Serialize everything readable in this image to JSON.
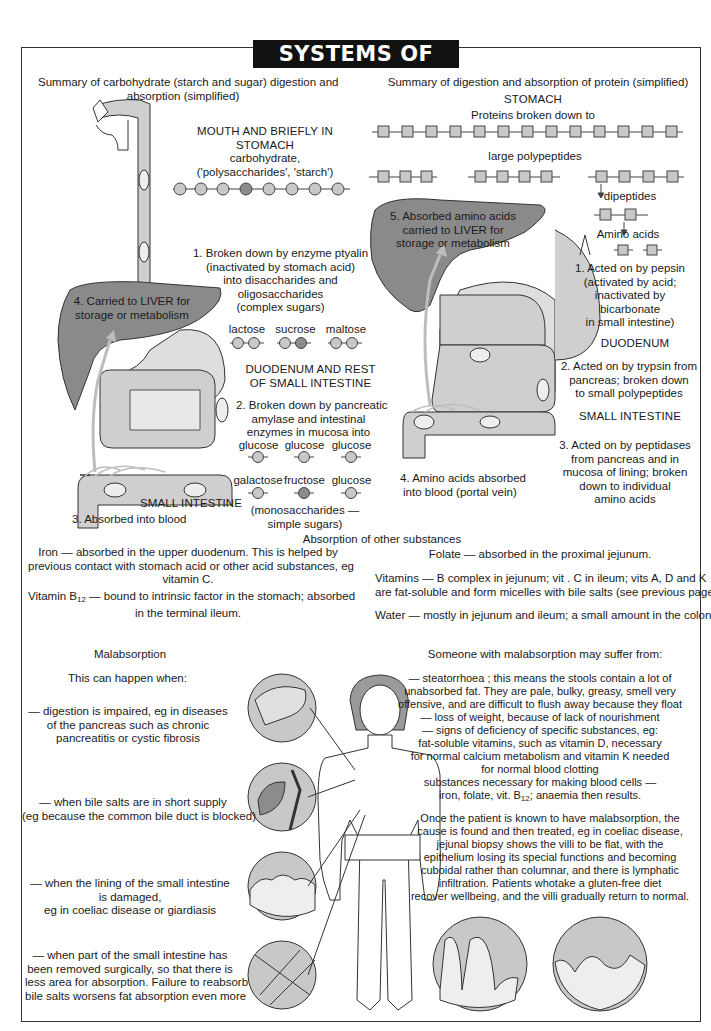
{
  "title": "SYSTEMS OF LIFE",
  "colors": {
    "liver": "#8a8a8a",
    "organ_light": "#cfcfcf",
    "organ_mid": "#b8b8b8",
    "molecule_light": "#c8c8c8",
    "molecule_dark": "#8c8c8c",
    "blood_arrow": "#bdbdbd",
    "text": "#1a1a1a",
    "title_bg": "#111111"
  },
  "carbohydrate": {
    "heading": [
      "Summary of carbohydrate (starch and sugar) digestion and",
      "absorption (simplified)"
    ],
    "mouth_label": [
      "MOUTH AND BRIEFLY IN",
      "STOMACH"
    ],
    "carb_label": [
      "carbohydrate,",
      "('polysaccharides', 'starch')"
    ],
    "polysaccharide_beads": [
      "light",
      "light",
      "light",
      "dark",
      "light",
      "light",
      "light",
      "light"
    ],
    "step1": [
      "1. Broken down by enzyme ptyalin",
      "(inactivated by stomach acid)",
      "into disaccharides and",
      "oligosaccharides",
      "(complex sugars)"
    ],
    "disaccharides": [
      {
        "name": "lactose",
        "beads": [
          "light",
          "light"
        ]
      },
      {
        "name": "sucrose",
        "beads": [
          "light",
          "dark"
        ]
      },
      {
        "name": "maltose",
        "beads": [
          "light",
          "light"
        ]
      }
    ],
    "liver_label": [
      "4. Carried to LIVER for",
      "storage or metabolism"
    ],
    "duodenum_label": [
      "DUODENUM AND REST",
      "OF SMALL INTESTINE"
    ],
    "step2": [
      "2. Broken down by pancreatic",
      "amylase and intestinal",
      "enzymes in mucosa into"
    ],
    "monosaccharides_row1": [
      "glucose",
      "glucose",
      "glucose"
    ],
    "monosaccharides_row2": [
      "galactose",
      "fructose",
      "glucose"
    ],
    "mono_note": [
      "(monosaccharides —",
      "simple sugars)"
    ],
    "small_intestine_label": "SMALL INTESTINE",
    "step3": "3. Absorbed into blood"
  },
  "protein": {
    "heading": "Summary of digestion and absorption of protein (simplified)",
    "stomach_label": "STOMACH",
    "proteins_label": "Proteins broken down to",
    "protein_chain_units": 13,
    "polypeptides_label": "large polypeptides",
    "polypeptide_groups": [
      3,
      4,
      4
    ],
    "dipeptides_label": "dipeptides",
    "amino_acids_label": "Amino acids",
    "liver_label": [
      "5. Absorbed amino acids",
      "carried to LIVER for",
      "storage or metabolism"
    ],
    "step1": [
      "1. Acted on by pepsin",
      "(activated by acid;",
      "inactivated by",
      "bicarbonate",
      "in small intestine)"
    ],
    "duodenum_label": "DUODENUM",
    "step2": [
      "2. Acted on by trypsin from",
      "pancreas; broken down",
      "to small polypeptides"
    ],
    "small_intestine_label": "SMALL INTESTINE",
    "step3": [
      "3. Acted on by peptidases",
      "from pancreas and in",
      "mucosa of lining;    broken",
      "down to individual",
      "amino acids"
    ],
    "step4": [
      "4. Amino acids absorbed",
      "into blood (portal vein)"
    ]
  },
  "other_substances": {
    "heading": "Absorption of other substances",
    "iron": [
      "Iron — absorbed in the upper duodenum. This is helped by",
      "previous contact with stomach acid or other acid substances, eg",
      "vitamin C."
    ],
    "b12_prefix": "Vitamin B",
    "b12_sub": "12",
    "b12_rest": " — bound to intrinsic factor in the stomach; absorbed",
    "b12_line2": "in the terminal ileum.",
    "folate": "Folate — absorbed in the proximal jejunum.",
    "vitamins": [
      "Vitamins — B complex in jejunum; vit . C in ileum; vits A, D and K",
      "are fat-soluble and form micelles with bile salts (see previous page)"
    ],
    "water": "Water — mostly in jejunum and ileum; a small amount in the colon."
  },
  "malabsorption": {
    "heading": "Malabsorption",
    "intro": "This can happen when:",
    "causes": [
      [
        "— digestion is impaired, eg in diseases",
        "of the pancreas such as chronic",
        "pancreatitis or cystic fibrosis"
      ],
      [
        "— when bile salts are in short supply",
        "(eg because the common bile duct is blocked)"
      ],
      [
        "— when the lining of the small intestine",
        "is damaged,",
        "eg in coeliac disease or giardiasis"
      ],
      [
        "— when part of the small intestine has",
        "been removed surgically, so that there is",
        "less area for absorption. Failure to reabsorb",
        "bile salts worsens fat absorption even more"
      ]
    ],
    "suffer_heading": "Someone with malabsorption may suffer from:",
    "symptoms": [
      "— steatorrhoea ; this means the stools contain a lot of",
      "unabsorbed fat. They are pale, bulky, greasy, smell very",
      "offensive, and are difficult to flush away because they float",
      "— loss of weight, because of lack of nourishment",
      "— signs of deficiency of specific substances, eg:",
      "fat-soluble vitamins, such as vitamin D, necessary",
      "for normal calcium metabolism and vitamin K needed",
      "for normal blood clotting",
      "substances necessary for making blood cells —"
    ],
    "anaemia_prefix": "iron, folate, vit. B",
    "anaemia_sub": "12",
    "anaemia_rest": "; anaemia then results.",
    "treatment": [
      "Once the patient is known to have malabsorption, the",
      "cause is found and then treated, eg in coeliac disease,",
      "jejunal biopsy shows the villi to be flat, with the",
      "epithelium  losing its special functions and becoming",
      "cuboidal rather than columnar, and there is lymphatic",
      "infiltration. Patients whotake a gluten-free diet",
      "recover wellbeing, and the villi gradually return to normal."
    ],
    "inset_icons": [
      "pancreas-inset",
      "gallbladder-duct-inset",
      "damaged-lining-inset",
      "resected-intestine-inset"
    ],
    "villi_comparison": [
      "normal-villi",
      "flat-villi"
    ]
  }
}
